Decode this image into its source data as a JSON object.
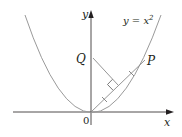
{
  "figure": {
    "width": 182,
    "height": 137,
    "background": "#ffffff",
    "colors": {
      "axis": "#231f20",
      "curve": "#9a9a9a",
      "segment": "#8a8a8a",
      "label": "#231f20"
    }
  },
  "axes": {
    "x_label": "x",
    "y_label": "y",
    "origin_label": "0"
  },
  "curve": {
    "equation_lhs": "y = x",
    "equation_exponent": "2",
    "description": "parabola y = x^2"
  },
  "points": {
    "Q": {
      "label": "Q",
      "position": "on y-axis"
    },
    "P": {
      "label": "P",
      "position": "on parabola"
    }
  },
  "constructions": [
    {
      "type": "segment",
      "from": "O",
      "to": "P"
    },
    {
      "type": "perpendicular",
      "from": "Q",
      "to": "segment OP",
      "right_angle_mark": true
    },
    {
      "type": "equal-length tick marks",
      "on": "segment OP",
      "count": 2
    }
  ]
}
